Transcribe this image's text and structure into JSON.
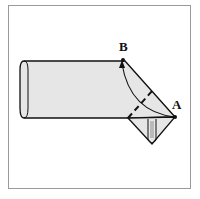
{
  "diagram": {
    "type": "folding-illustration",
    "labels": {
      "point_a": "A",
      "point_b": "B"
    },
    "colors": {
      "fill": "#e6e6e6",
      "stroke": "#111111",
      "frame": "#9a9a9a"
    }
  }
}
